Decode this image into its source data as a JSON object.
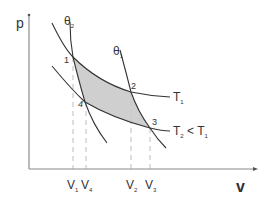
{
  "diagram": {
    "axes": {
      "y_label": "p",
      "x_label": "v"
    },
    "points": [
      {
        "id": "1",
        "label": "1"
      },
      {
        "id": "2",
        "label": "2"
      },
      {
        "id": "3",
        "label": "3"
      },
      {
        "id": "4",
        "label": "4"
      }
    ],
    "adiabats": [
      {
        "label_main": "θ",
        "label_sub": "2"
      },
      {
        "label_main": "θ",
        "label_sub": "1"
      }
    ],
    "isotherms": [
      {
        "label_main": "T",
        "label_sub": "1"
      },
      {
        "label_main": "T",
        "label_sub": "2",
        "label_rest": " < T",
        "label_rest_sub": "1"
      }
    ],
    "volume_ticks": [
      {
        "main": "V",
        "sub": "1"
      },
      {
        "main": "V",
        "sub": "4"
      },
      {
        "main": "V",
        "sub": "2"
      },
      {
        "main": "V",
        "sub": "3"
      }
    ],
    "colors": {
      "axis": "#8a8a8a",
      "curve": "#333333",
      "fill": "#cfcfcf",
      "dashed": "#c8c8c8",
      "text": "#333333"
    }
  }
}
